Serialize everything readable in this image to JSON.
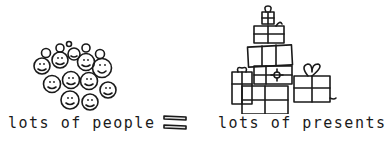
{
  "illustration": {
    "left_group": {
      "label": "lots of people",
      "icon": "smiley-faces-crowd"
    },
    "operator": {
      "symbol": "=",
      "icon": "equals-sign"
    },
    "right_group": {
      "label": "lots of presents",
      "icon": "stack-of-gift-boxes"
    },
    "colors": {
      "ink": "#1a1a1a",
      "background": "#ffffff"
    }
  }
}
